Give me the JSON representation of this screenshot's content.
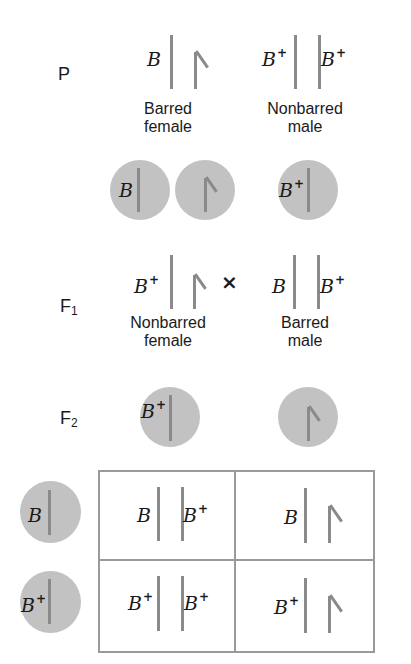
{
  "generations": {
    "p": "P",
    "f1": "F",
    "f1_sub": "1",
    "f2": "F",
    "f2_sub": "2"
  },
  "parental": {
    "female": {
      "allele": "B",
      "sup": "",
      "label_line1": "Barred",
      "label_line2": "female",
      "chromosomes": [
        "Z",
        "W"
      ]
    },
    "male": {
      "allele1": "B",
      "sup1": "+",
      "allele2": "B",
      "sup2": "+",
      "label_line1": "Nonbarred",
      "label_line2": "male",
      "chromosomes": [
        "Z",
        "Z"
      ]
    }
  },
  "parental_gametes": [
    {
      "allele": "B",
      "sup": "",
      "chromosome": "Z"
    },
    {
      "allele": "",
      "sup": "",
      "chromosome": "W"
    },
    {
      "allele": "B",
      "sup": "+",
      "chromosome": "Z"
    }
  ],
  "f1": {
    "female": {
      "allele": "B",
      "sup": "+",
      "label_line1": "Nonbarred",
      "label_line2": "female",
      "chromosomes": [
        "Z",
        "W"
      ]
    },
    "cross_symbol": "×",
    "male": {
      "allele1": "B",
      "sup1": "",
      "allele2": "B",
      "sup2": "+",
      "label_line1": "Barred",
      "label_line2": "male",
      "chromosomes": [
        "Z",
        "Z"
      ]
    }
  },
  "f2_gametes_top": [
    {
      "allele": "B",
      "sup": "+",
      "chromosome": "Z"
    },
    {
      "allele": "",
      "sup": "",
      "chromosome": "W"
    }
  ],
  "f2_gametes_side": [
    {
      "allele": "B",
      "sup": "",
      "chromosome": "Z"
    },
    {
      "allele": "B",
      "sup": "+",
      "chromosome": "Z"
    }
  ],
  "punnett": [
    [
      {
        "a1": "B",
        "s1": "",
        "a2": "B",
        "s2": "+",
        "type": "ZZ"
      },
      {
        "a1": "B",
        "s1": "",
        "a2": "",
        "s2": "",
        "type": "ZW"
      }
    ],
    [
      {
        "a1": "B",
        "s1": "+",
        "a2": "B",
        "s2": "+",
        "type": "ZZ"
      },
      {
        "a1": "B",
        "s1": "+",
        "a2": "",
        "s2": "",
        "type": "ZW"
      }
    ]
  ],
  "colors": {
    "circle_fill": "#c2c2c2",
    "chromosome": "#8a8a8a",
    "box_border": "#9a9a9a"
  }
}
